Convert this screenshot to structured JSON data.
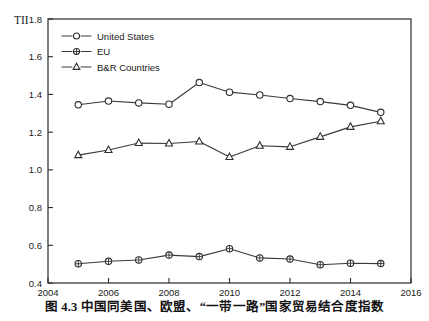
{
  "figure": {
    "caption": "图 4.3   中国同美国、欧盟、“一带一路”国家贸易结合度指数",
    "y_axis_name": "TII"
  },
  "chart_data": {
    "type": "line",
    "title": "",
    "xlabel": "",
    "ylabel": "TII",
    "xlim": [
      2004,
      2016
    ],
    "ylim": [
      0.4,
      1.8
    ],
    "x_ticks": [
      2004,
      2006,
      2008,
      2010,
      2012,
      2014,
      2016
    ],
    "x_tick_labels": [
      "2004",
      "2006",
      "2008",
      "2010",
      "2012",
      "2014",
      "2016"
    ],
    "y_ticks": [
      0.4,
      0.6,
      0.8,
      1.0,
      1.2,
      1.4,
      1.6,
      1.8
    ],
    "y_tick_labels": [
      "0.4",
      "0.6",
      "0.8",
      "1.0",
      "1.2",
      "1.4",
      "1.6",
      "1.8"
    ],
    "grid": false,
    "legend_position": "top-left",
    "x": [
      2005,
      2006,
      2007,
      2008,
      2009,
      2010,
      2011,
      2012,
      2013,
      2014,
      2015
    ],
    "series": [
      {
        "name": "United States",
        "marker": "circle",
        "color": "#2f2f2f",
        "values": [
          1.345,
          1.365,
          1.355,
          1.348,
          1.463,
          1.412,
          1.397,
          1.378,
          1.362,
          1.342,
          1.305
        ]
      },
      {
        "name": "EU",
        "marker": "crossed-circle",
        "color": "#2f2f2f",
        "values": [
          0.502,
          0.515,
          0.522,
          0.548,
          0.54,
          0.582,
          0.533,
          0.527,
          0.497,
          0.505,
          0.503
        ]
      },
      {
        "name": "B&R Countries",
        "marker": "triangle",
        "color": "#2f2f2f",
        "values": [
          1.078,
          1.105,
          1.142,
          1.14,
          1.15,
          1.068,
          1.128,
          1.122,
          1.175,
          1.228,
          1.258
        ]
      }
    ]
  }
}
